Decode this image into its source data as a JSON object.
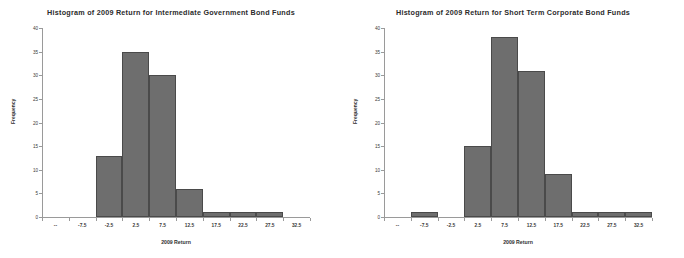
{
  "chart_data": [
    {
      "type": "bar",
      "title": "Histogram of 2009 Return for Intermediate Government Bond Funds",
      "xlabel": "2009 Return",
      "ylabel": "Frequency",
      "categories": [
        "--",
        "-7.5",
        "-2.5",
        "2.5",
        "7.5",
        "12.5",
        "17.5",
        "22.5",
        "27.5",
        "32.5"
      ],
      "values": [
        0,
        0,
        13,
        35,
        30,
        6,
        1,
        1,
        1,
        0
      ],
      "ylim": [
        0,
        40
      ],
      "yticks": [
        0,
        5,
        10,
        15,
        20,
        25,
        30,
        35,
        40
      ],
      "grid": false,
      "legend": false,
      "bar_color": "#6e6e6e",
      "bar_edge_color": "#4a4a4a"
    },
    {
      "type": "bar",
      "title": "Histogram of 2009 Return for Short Term Corporate Bond Funds",
      "xlabel": "2009 Return",
      "ylabel": "Frequency",
      "categories": [
        "--",
        "-7.5",
        "-2.5",
        "2.5",
        "7.5",
        "12.5",
        "17.5",
        "22.5",
        "27.5",
        "32.5"
      ],
      "values": [
        0,
        1,
        0,
        15,
        38,
        31,
        9,
        1,
        1,
        1
      ],
      "ylim": [
        0,
        40
      ],
      "yticks": [
        0,
        5,
        10,
        15,
        20,
        25,
        30,
        35,
        40
      ],
      "grid": false,
      "legend": false,
      "bar_color": "#6e6e6e",
      "bar_edge_color": "#4a4a4a"
    }
  ]
}
